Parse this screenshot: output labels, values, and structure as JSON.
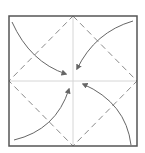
{
  "diagram": {
    "type": "origami-fold-step",
    "colors": {
      "background": "#ffffff",
      "border": "#555555",
      "dashed_line": "#888888",
      "crease": "#d6d6d6",
      "arrow": "#666666"
    },
    "square": {
      "x1": 9,
      "y1": 16,
      "x2": 137,
      "y2": 146
    },
    "center": {
      "x": 73,
      "y": 81
    },
    "dashed_diamond": [
      {
        "x": 73,
        "y": 16
      },
      {
        "x": 137,
        "y": 81
      },
      {
        "x": 73,
        "y": 146
      },
      {
        "x": 9,
        "y": 81
      }
    ],
    "arrows": [
      {
        "name": "fold-arrow-top-left",
        "path": "M 12 22 Q 30 62 66 74",
        "tip": {
          "x": 66,
          "y": 74
        }
      },
      {
        "name": "fold-arrow-top-right",
        "path": "M 133 21 Q 95 32 77 69",
        "tip": {
          "x": 77,
          "y": 69
        }
      },
      {
        "name": "fold-arrow-bottom-left",
        "path": "M 14 140 Q 56 130 69 89",
        "tip": {
          "x": 69,
          "y": 89
        }
      },
      {
        "name": "fold-arrow-bottom-right",
        "path": "M 131 145 Q 126 103 83 84",
        "tip": {
          "x": 83,
          "y": 84
        }
      }
    ]
  }
}
